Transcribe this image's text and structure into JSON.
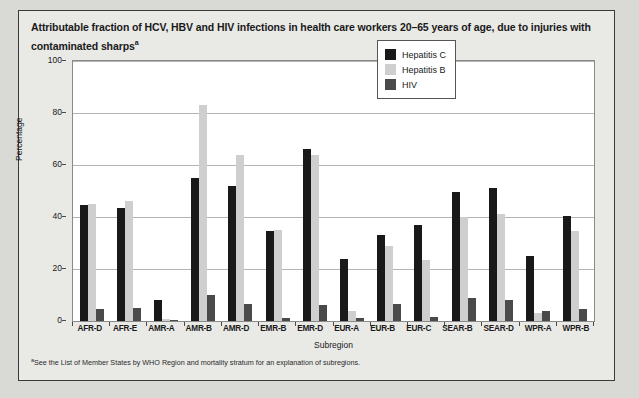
{
  "figure": {
    "title": "Attributable fraction of HCV, HBV and HIV infections in health care workers 20–65 years of age, due to injuries with contaminated sharps",
    "title_footnote_marker": "a",
    "footnote_marker": "a",
    "footnote": "See the List of Member States by WHO Region and mortality stratum for an explanation of subregions."
  },
  "colors": {
    "hepatitis_c": "#191919",
    "hepatitis_b": "#cfcfcf",
    "hiv": "#4a4a4a",
    "page_background": "#d9d9d6",
    "panel_background": "#e9e9e6",
    "plot_background": "#ffffff",
    "gridline": "#b4b4b4"
  },
  "chart_data": {
    "type": "bar",
    "title": "Attributable fraction of HCV, HBV and HIV infections in health care workers 20–65 years of age, due to injuries with contaminated sharps",
    "xlabel": "Subregion",
    "ylabel": "Percentage",
    "ylim": [
      0,
      100
    ],
    "yticks": [
      0,
      20,
      40,
      60,
      80,
      100
    ],
    "ytick_labels": [
      "0",
      "20",
      "40",
      "60",
      "80",
      "100"
    ],
    "grid": true,
    "legend_position": "upper right",
    "categories": [
      "AFR-D",
      "AFR-E",
      "AMR-A",
      "AMR-B",
      "AMR-D",
      "EMR-B",
      "EMR-D",
      "EUR-A",
      "EUR-B",
      "EUR-C",
      "SEAR-B",
      "SEAR-D",
      "WPR-A",
      "WPR-B"
    ],
    "series": [
      {
        "name": "Hepatitis C",
        "color": "#191919",
        "values": [
          44.5,
          43.5,
          8.0,
          55.0,
          52.0,
          34.5,
          66.0,
          24.0,
          33.0,
          37.0,
          49.5,
          51.0,
          25.0,
          40.5
        ]
      },
      {
        "name": "Hepatitis B",
        "color": "#cfcfcf",
        "values": [
          45.0,
          46.0,
          0.7,
          83.0,
          64.0,
          35.0,
          64.0,
          4.0,
          29.0,
          23.5,
          40.0,
          41.0,
          3.0,
          34.5
        ]
      },
      {
        "name": "HIV",
        "color": "#4a4a4a",
        "values": [
          4.5,
          5.0,
          0.3,
          10.0,
          6.5,
          1.0,
          6.0,
          1.0,
          6.5,
          1.5,
          9.0,
          8.0,
          4.0,
          4.5
        ]
      }
    ]
  }
}
